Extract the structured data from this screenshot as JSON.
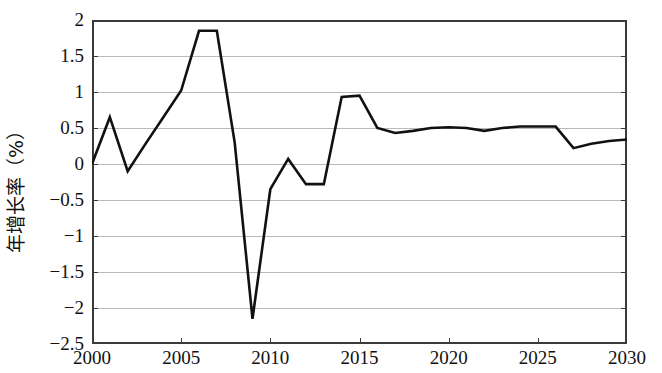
{
  "chart_data": {
    "type": "line",
    "title": "",
    "subtitle": "",
    "xlabel": "",
    "ylabel": "年增长率（%）",
    "xlim": [
      2000,
      2030
    ],
    "ylim": [
      -2.5,
      2
    ],
    "grid": true,
    "legend": null,
    "x_ticks": [
      "2000",
      "2005",
      "2010",
      "2015",
      "2020",
      "2025",
      "2030"
    ],
    "x_tick_values": [
      2000,
      2005,
      2010,
      2015,
      2020,
      2025,
      2030
    ],
    "y_ticks": [
      "2",
      "1.5",
      "1",
      "0.5",
      "0",
      "−0.5",
      "−1",
      "−1.5",
      "−2",
      "−2.5"
    ],
    "y_tick_values": [
      2,
      1.5,
      1,
      0.5,
      0,
      -0.5,
      -1,
      -1.5,
      -2,
      -2.5
    ],
    "x": [
      2000,
      2001,
      2002,
      2003,
      2004,
      2005,
      2006,
      2007,
      2008,
      2009,
      2010,
      2011,
      2012,
      2013,
      2014,
      2015,
      2016,
      2017,
      2018,
      2019,
      2020,
      2021,
      2022,
      2023,
      2024,
      2025,
      2026,
      2027,
      2028,
      2029,
      2030
    ],
    "values": [
      0.0,
      0.65,
      -0.1,
      0.28,
      0.65,
      1.02,
      1.85,
      1.85,
      0.3,
      -2.15,
      -0.35,
      0.07,
      -0.28,
      -0.28,
      0.93,
      0.95,
      0.5,
      0.43,
      0.46,
      0.5,
      0.51,
      0.5,
      0.46,
      0.5,
      0.52,
      0.52,
      0.52,
      0.22,
      0.28,
      0.32,
      0.34
    ],
    "series": [
      {
        "name": "年增长率",
        "color": "#111111",
        "values": [
          0.0,
          0.65,
          -0.1,
          0.28,
          0.65,
          1.02,
          1.85,
          1.85,
          0.3,
          -2.15,
          -0.35,
          0.07,
          -0.28,
          -0.28,
          0.93,
          0.95,
          0.5,
          0.43,
          0.46,
          0.5,
          0.51,
          0.5,
          0.46,
          0.5,
          0.52,
          0.52,
          0.52,
          0.22,
          0.28,
          0.32,
          0.34
        ]
      }
    ],
    "colors": {
      "line": "#111111",
      "grid": "#b9b9b9",
      "axis": "#3a3a3a",
      "background": "#ffffff"
    }
  }
}
